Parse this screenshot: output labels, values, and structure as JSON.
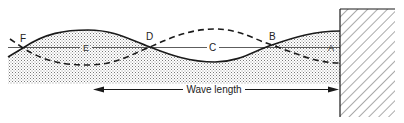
{
  "diagram": {
    "labels": {
      "F": "F",
      "E": "E",
      "D": "D",
      "C": "C",
      "B": "B",
      "A": "A"
    },
    "wave_length_label": "Wave length",
    "elements": {
      "solid_wave": "water surface at one phase",
      "dashed_wave": "water surface at opposite phase",
      "still_water_line": "mean water level",
      "wall": "vertical reflecting wall (hatched)",
      "water_body": "stippled water"
    },
    "colors": {
      "line": "#1a1a1a",
      "stipple": "#8a8a8a",
      "background": "#ffffff"
    }
  }
}
